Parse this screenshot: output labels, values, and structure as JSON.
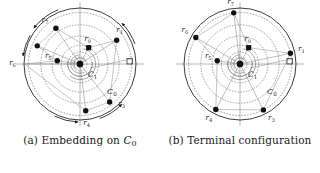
{
  "figure": {
    "panels": [
      {
        "id": "panel-a",
        "caption_prefix": "(a)",
        "caption_text": "Embedding on",
        "caption_symbol": "C",
        "caption_symbol_sub": "0",
        "outer_circle_label": "C",
        "outer_circle_label_sub": "0",
        "inner_circle_label": "C",
        "inner_circle_label_sub": "1",
        "has_motion_arrows": true,
        "nodes": [
          {
            "label": "r",
            "sub": "0",
            "angle_deg": 62,
            "radius_frac": 0.33,
            "shape": "square",
            "label_dx": -1,
            "label_dy": -7,
            "anchor": "middle"
          },
          {
            "label": "r",
            "sub": "1",
            "angle_deg": 33,
            "radius_frac": 0.78,
            "shape": "circle",
            "label_dx": 3,
            "label_dy": -8,
            "anchor": "middle"
          },
          {
            "label": "r",
            "sub": "3",
            "angle_deg": -52,
            "radius_frac": 0.86,
            "shape": "circle",
            "label_dx": 12,
            "label_dy": 4,
            "anchor": "middle"
          },
          {
            "label": "r",
            "sub": "4",
            "angle_deg": -83,
            "radius_frac": 0.84,
            "shape": "circle",
            "label_dx": 1,
            "label_dy": 14,
            "anchor": "middle"
          },
          {
            "label": "r",
            "sub": "5",
            "angle_deg": 172,
            "radius_frac": 0.41,
            "shape": "circle",
            "label_dx": -9,
            "label_dy": -3,
            "anchor": "middle"
          },
          {
            "label": "r",
            "sub": "6",
            "angle_deg": 180,
            "radius_frac": 0.99,
            "shape": "none",
            "label_dx": -12,
            "label_dy": 1,
            "anchor": "middle"
          },
          {
            "label": "r",
            "sub": "6b",
            "angle_deg": 157,
            "radius_frac": 0.83,
            "shape": "circle",
            "label_dx": 0,
            "label_dy": 0,
            "anchor": "middle",
            "hide_label": true
          },
          {
            "label": "r",
            "sub": "7",
            "angle_deg": 124,
            "radius_frac": 0.77,
            "shape": "circle",
            "label_dx": -11,
            "label_dy": -6,
            "anchor": "middle"
          }
        ]
      },
      {
        "id": "panel-b",
        "caption_prefix": "(b)",
        "caption_text": "Terminal configuration",
        "caption_symbol": "",
        "caption_symbol_sub": "",
        "outer_circle_label": "C",
        "outer_circle_label_sub": "0",
        "inner_circle_label": "C",
        "inner_circle_label_sub": "1",
        "has_motion_arrows": false,
        "nodes": [
          {
            "label": "r",
            "sub": "0",
            "angle_deg": 62,
            "radius_frac": 0.33,
            "shape": "square",
            "label_dx": -1,
            "label_dy": -7,
            "anchor": "middle"
          },
          {
            "label": "r",
            "sub": "1",
            "angle_deg": 12,
            "radius_frac": 0.92,
            "shape": "circle",
            "label_dx": 11,
            "label_dy": -2,
            "anchor": "middle"
          },
          {
            "label": "r",
            "sub": "3",
            "angle_deg": -63,
            "radius_frac": 0.92,
            "shape": "circle",
            "label_dx": 8,
            "label_dy": 10,
            "anchor": "middle"
          },
          {
            "label": "r",
            "sub": "4",
            "angle_deg": -118,
            "radius_frac": 0.92,
            "shape": "circle",
            "label_dx": -7,
            "label_dy": 11,
            "anchor": "middle"
          },
          {
            "label": "r",
            "sub": "5",
            "angle_deg": 172,
            "radius_frac": 0.41,
            "shape": "circle",
            "label_dx": -9,
            "label_dy": -3,
            "anchor": "middle"
          },
          {
            "label": "r",
            "sub": "6",
            "angle_deg": 149,
            "radius_frac": 0.92,
            "shape": "circle",
            "label_dx": -11,
            "label_dy": -5,
            "anchor": "middle"
          },
          {
            "label": "r",
            "sub": "7",
            "angle_deg": 97,
            "radius_frac": 0.92,
            "shape": "circle",
            "label_dx": -3,
            "label_dy": -9,
            "anchor": "middle"
          }
        ]
      }
    ],
    "colors": {
      "ink": "#1a1a1a",
      "node_fill": "#111111",
      "guide": "#8a8a8a",
      "dashed": "#555555",
      "background": "#ffffff"
    }
  }
}
